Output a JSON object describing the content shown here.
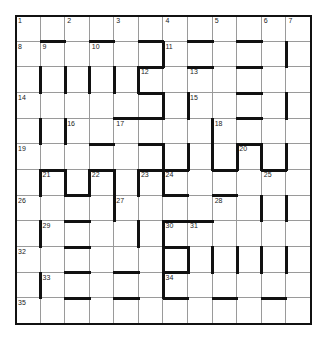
{
  "puzzle": {
    "type": "barred-crossword",
    "rows": 12,
    "cols": 12,
    "numbers": [
      {
        "n": "1",
        "r": 0,
        "c": 0
      },
      {
        "n": "2",
        "r": 0,
        "c": 2
      },
      {
        "n": "3",
        "r": 0,
        "c": 4
      },
      {
        "n": "4",
        "r": 0,
        "c": 6
      },
      {
        "n": "5",
        "r": 0,
        "c": 8
      },
      {
        "n": "6",
        "r": 0,
        "c": 10
      },
      {
        "n": "7",
        "r": 0,
        "c": 11
      },
      {
        "n": "8",
        "r": 1,
        "c": 0
      },
      {
        "n": "9",
        "r": 1,
        "c": 1
      },
      {
        "n": "10",
        "r": 1,
        "c": 3
      },
      {
        "n": "11",
        "r": 1,
        "c": 6
      },
      {
        "n": "12",
        "r": 2,
        "c": 5
      },
      {
        "n": "13",
        "r": 2,
        "c": 7
      },
      {
        "n": "14",
        "r": 3,
        "c": 0
      },
      {
        "n": "15",
        "r": 3,
        "c": 7
      },
      {
        "n": "16",
        "r": 4,
        "c": 2
      },
      {
        "n": "17",
        "r": 4,
        "c": 4
      },
      {
        "n": "18",
        "r": 4,
        "c": 8
      },
      {
        "n": "19",
        "r": 5,
        "c": 0
      },
      {
        "n": "20",
        "r": 5,
        "c": 9
      },
      {
        "n": "21",
        "r": 6,
        "c": 1
      },
      {
        "n": "22",
        "r": 6,
        "c": 3
      },
      {
        "n": "23",
        "r": 6,
        "c": 5
      },
      {
        "n": "24",
        "r": 6,
        "c": 6
      },
      {
        "n": "25",
        "r": 6,
        "c": 10
      },
      {
        "n": "26",
        "r": 7,
        "c": 0
      },
      {
        "n": "27",
        "r": 7,
        "c": 4
      },
      {
        "n": "28",
        "r": 7,
        "c": 8
      },
      {
        "n": "29",
        "r": 8,
        "c": 1
      },
      {
        "n": "30",
        "r": 8,
        "c": 6
      },
      {
        "n": "31",
        "r": 8,
        "c": 7
      },
      {
        "n": "32",
        "r": 9,
        "c": 0
      },
      {
        "n": "33",
        "r": 10,
        "c": 1
      },
      {
        "n": "34",
        "r": 10,
        "c": 6
      },
      {
        "n": "35",
        "r": 11,
        "c": 0
      }
    ],
    "hbars": [
      [
        1,
        1
      ],
      [
        1,
        3
      ],
      [
        1,
        5
      ],
      [
        1,
        7
      ],
      [
        1,
        9
      ],
      [
        2,
        5
      ],
      [
        2,
        7
      ],
      [
        2,
        9
      ],
      [
        3,
        5
      ],
      [
        3,
        9
      ],
      [
        4,
        4
      ],
      [
        4,
        5
      ],
      [
        4,
        9
      ],
      [
        5,
        3
      ],
      [
        5,
        5
      ],
      [
        5,
        9
      ],
      [
        6,
        1
      ],
      [
        6,
        3
      ],
      [
        6,
        5
      ],
      [
        6,
        6
      ],
      [
        6,
        8
      ],
      [
        6,
        10
      ],
      [
        7,
        2
      ],
      [
        7,
        6
      ],
      [
        7,
        8
      ],
      [
        8,
        2
      ],
      [
        8,
        6
      ],
      [
        8,
        7
      ],
      [
        9,
        2
      ],
      [
        9,
        6
      ],
      [
        10,
        2
      ],
      [
        10,
        4
      ],
      [
        10,
        6
      ],
      [
        11,
        2
      ],
      [
        11,
        4
      ],
      [
        11,
        6
      ],
      [
        11,
        8
      ],
      [
        11,
        10
      ]
    ],
    "vbars": [
      [
        1,
        6
      ],
      [
        1,
        11
      ],
      [
        2,
        1
      ],
      [
        2,
        2
      ],
      [
        2,
        3
      ],
      [
        2,
        4
      ],
      [
        2,
        5
      ],
      [
        3,
        6
      ],
      [
        3,
        7
      ],
      [
        3,
        11
      ],
      [
        4,
        1
      ],
      [
        4,
        2
      ],
      [
        4,
        8
      ],
      [
        5,
        6
      ],
      [
        5,
        7
      ],
      [
        5,
        8
      ],
      [
        5,
        9
      ],
      [
        5,
        10
      ],
      [
        5,
        11
      ],
      [
        6,
        1
      ],
      [
        6,
        2
      ],
      [
        6,
        3
      ],
      [
        6,
        4
      ],
      [
        6,
        5
      ],
      [
        6,
        6
      ],
      [
        7,
        4
      ],
      [
        7,
        10
      ],
      [
        7,
        11
      ],
      [
        8,
        1
      ],
      [
        8,
        5
      ],
      [
        8,
        6
      ],
      [
        9,
        6
      ],
      [
        9,
        7
      ],
      [
        9,
        8
      ],
      [
        9,
        9
      ],
      [
        9,
        10
      ],
      [
        9,
        11
      ],
      [
        10,
        1
      ],
      [
        10,
        6
      ]
    ]
  }
}
